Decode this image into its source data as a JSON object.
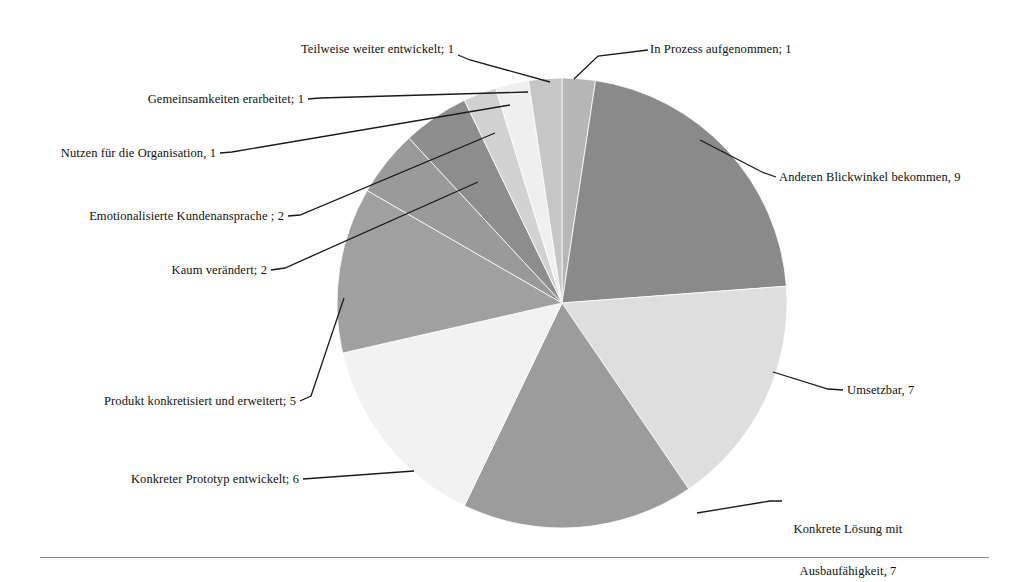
{
  "chart_data": {
    "type": "pie",
    "title": "",
    "subtitle": "",
    "xlabel": "",
    "ylabel": "",
    "legend_position": "callout-labels",
    "grid": false,
    "total": 42,
    "start_angle_deg": 0,
    "direction": "clockwise",
    "categories": [
      "In Prozess aufgenommen",
      "Anderen Blickwinkel bekommen",
      "Umsetzbar",
      "Konkrete Lösung mit Ausbaufähigkeit",
      "Konkreter Prototyp entwickelt",
      "Produkt konkretisiert und erweitert",
      "Kaum verändert",
      "Emotionalisierte Kundenansprache",
      "Nutzen für die Organisation",
      "Gemeinsamkeiten erarbeitet",
      "Teilweise weiter entwickelt"
    ],
    "values": [
      1,
      9,
      7,
      7,
      6,
      5,
      2,
      2,
      1,
      1,
      1
    ],
    "colors": [
      "#b6b6b6",
      "#8a8a8a",
      "#dedede",
      "#9c9c9c",
      "#f2f2f2",
      "#a0a0a0",
      "#9a9a9a",
      "#8d8d8d",
      "#d2d2d2",
      "#efefef",
      "#c6c6c6"
    ],
    "slice_label_texts": [
      "In Prozess aufgenommen; 1",
      "Anderen Blickwinkel bekommen, 9",
      "Umsetzbar, 7",
      "Konkrete Lösung mit\nAusbaufähigkeit, 7",
      "Konkreter Prototyp entwickelt; 6",
      "Produkt konkretisiert und erweitert; 5",
      "Kaum verändert; 2",
      "Emotionalisierte Kundenansprache ; 2",
      "Nutzen für die Organisation, 1",
      "Gemeinsamkeiten erarbeitet; 1",
      "Teilweise weiter entwickelt; 1"
    ]
  },
  "labels": {
    "in_prozess": "In Prozess aufgenommen; 1",
    "anderen_blickwinkel": "Anderen Blickwinkel bekommen, 9",
    "umsetzbar": "Umsetzbar, 7",
    "konkrete_loesung_line1": "Konkrete Lösung mit",
    "konkrete_loesung_line2": "Ausbaufähigkeit, 7",
    "konkreter_prototyp": "Konkreter Prototyp entwickelt; 6",
    "produkt_konkretisiert": "Produkt konkretisiert und erweitert; 5",
    "kaum_veraendert": "Kaum verändert; 2",
    "emotionalisierte": "Emotionalisierte Kundenansprache ; 2",
    "nutzen_organisation": "Nutzen für die Organisation, 1",
    "gemeinsamkeiten": "Gemeinsamkeiten erarbeitet; 1",
    "teilweise_weiter": "Teilweise weiter entwickelt; 1"
  },
  "style": {
    "background": "#ffffff",
    "leader_line_color": "#1a1a1a",
    "rule_color": "#8e8e8e",
    "text_color": "#121212"
  }
}
